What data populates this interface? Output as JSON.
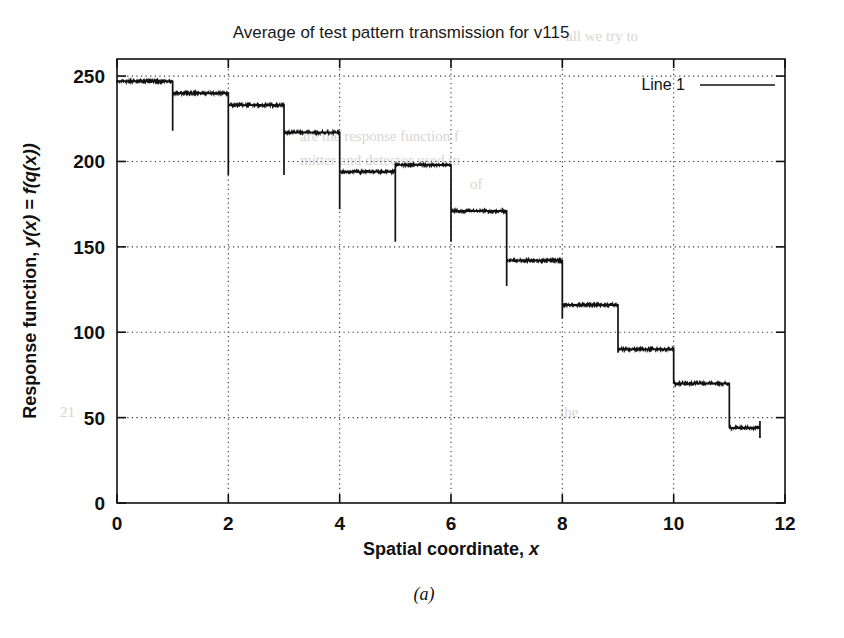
{
  "figure": {
    "caption": "(a)",
    "background_color": "#ffffff",
    "ink_color": "#111111"
  },
  "chart_data": {
    "type": "line",
    "title": "Average of test pattern transmission for v115",
    "xlabel": "Spatial coordinate, x",
    "ylabel": "Response function, y(x) = f(q(x))",
    "xlim": [
      0,
      12
    ],
    "ylim": [
      0,
      260
    ],
    "xticks": [
      0,
      2,
      4,
      6,
      8,
      10,
      12
    ],
    "yticks": [
      0,
      50,
      100,
      150,
      200,
      250
    ],
    "xticklabels": [
      "0",
      "2",
      "4",
      "6",
      "8",
      "10",
      "12"
    ],
    "yticklabels": [
      "0",
      "50",
      "100",
      "150",
      "200",
      "250"
    ],
    "grid": true,
    "grid_style": "dotted",
    "legend": {
      "position": "top-right",
      "entries": [
        {
          "label": "Line 1",
          "color": "#111111",
          "style": "solid"
        }
      ]
    },
    "series": [
      {
        "name": "Line 1",
        "color": "#111111",
        "steps": [
          {
            "x_start": 0.0,
            "x_end": 1.0,
            "level": 247,
            "overshoot_low": 218
          },
          {
            "x_start": 1.0,
            "x_end": 2.0,
            "level": 240,
            "overshoot_low": 192
          },
          {
            "x_start": 2.0,
            "x_end": 3.0,
            "level": 233,
            "overshoot_low": 192
          },
          {
            "x_start": 3.0,
            "x_end": 4.0,
            "level": 217,
            "overshoot_low": 172
          },
          {
            "x_start": 4.0,
            "x_end": 5.0,
            "level": 194,
            "overshoot_low": 153
          },
          {
            "x_start": 5.0,
            "x_end": 6.0,
            "level": 198,
            "overshoot_low": 153
          },
          {
            "x_start": 6.0,
            "x_end": 7.0,
            "level": 171,
            "overshoot_low": 127
          },
          {
            "x_start": 7.0,
            "x_end": 8.0,
            "level": 142,
            "overshoot_low": 108
          },
          {
            "x_start": 8.0,
            "x_end": 9.0,
            "level": 116,
            "overshoot_low": 88
          },
          {
            "x_start": 9.0,
            "x_end": 10.0,
            "level": 90,
            "overshoot_low": 70
          },
          {
            "x_start": 10.0,
            "x_end": 11.0,
            "level": 70,
            "overshoot_low": 44
          },
          {
            "x_start": 11.0,
            "x_end": 11.55,
            "level": 44,
            "overshoot_low": 38
          }
        ],
        "tail": {
          "x": 11.55,
          "level": 48
        }
      }
    ]
  },
  "ghost_text": {
    "note": "faint show-through text from reverse page",
    "lines": [
      {
        "text": "all we try to",
        "x": 566,
        "y": 28
      },
      {
        "text": "are the response function f",
        "x": 300,
        "y": 128
      },
      {
        "text": "mitter and detector used in",
        "x": 300,
        "y": 152
      },
      {
        "text": "of",
        "x": 470,
        "y": 176
      },
      {
        "text": "21",
        "x": 60,
        "y": 404
      },
      {
        "text": "the",
        "x": 560,
        "y": 404
      }
    ]
  }
}
